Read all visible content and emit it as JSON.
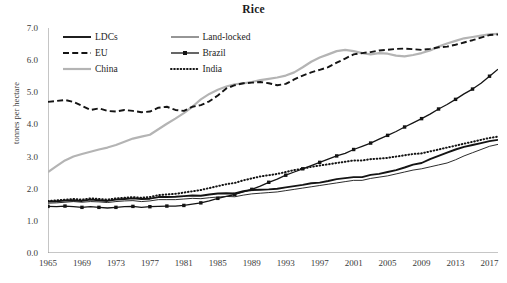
{
  "chart_data": {
    "type": "line",
    "title": "Rice",
    "xlabel": "",
    "ylabel": "tonnes per hectare",
    "ylim": [
      0,
      7
    ],
    "ytick_labels": [
      "0.0",
      "1.0",
      "2.0",
      "3.0",
      "4.0",
      "5.0",
      "6.0",
      "7.0"
    ],
    "ytick_values": [
      0,
      1,
      2,
      3,
      4,
      5,
      6,
      7
    ],
    "xlim": [
      1965,
      2018
    ],
    "xtick_labels": [
      "1965",
      "1969",
      "1973",
      "1977",
      "1981",
      "1985",
      "1989",
      "1993",
      "1997",
      "2001",
      "2005",
      "2009",
      "2013",
      "2017"
    ],
    "xtick_values": [
      1965,
      1969,
      1973,
      1977,
      1981,
      1985,
      1989,
      1993,
      1997,
      2001,
      2005,
      2009,
      2013,
      2017
    ],
    "grid": false,
    "legend_position": "top-left-inside",
    "x": [
      1965,
      1966,
      1967,
      1968,
      1969,
      1970,
      1971,
      1972,
      1973,
      1974,
      1975,
      1976,
      1977,
      1978,
      1979,
      1980,
      1981,
      1982,
      1983,
      1984,
      1985,
      1986,
      1987,
      1988,
      1989,
      1990,
      1991,
      1992,
      1993,
      1994,
      1995,
      1996,
      1997,
      1998,
      1999,
      2000,
      2001,
      2002,
      2003,
      2004,
      2005,
      2006,
      2007,
      2008,
      2009,
      2010,
      2011,
      2012,
      2013,
      2014,
      2015,
      2016,
      2017,
      2018
    ],
    "series": [
      {
        "name": "LDCs",
        "style": "solid-thick",
        "color": "#141414",
        "values": [
          1.6,
          1.61,
          1.63,
          1.64,
          1.62,
          1.66,
          1.64,
          1.62,
          1.66,
          1.68,
          1.7,
          1.68,
          1.69,
          1.74,
          1.74,
          1.75,
          1.77,
          1.79,
          1.78,
          1.82,
          1.85,
          1.86,
          1.85,
          1.92,
          1.96,
          1.97,
          1.98,
          2.0,
          2.04,
          2.08,
          2.12,
          2.17,
          2.19,
          2.24,
          2.3,
          2.33,
          2.36,
          2.36,
          2.43,
          2.46,
          2.52,
          2.58,
          2.66,
          2.75,
          2.8,
          2.92,
          3.02,
          3.12,
          3.22,
          3.3,
          3.36,
          3.42,
          3.48,
          3.52
        ]
      },
      {
        "name": "EU",
        "style": "dashed",
        "color": "#141414",
        "values": [
          4.7,
          4.73,
          4.76,
          4.7,
          4.58,
          4.45,
          4.5,
          4.42,
          4.4,
          4.45,
          4.42,
          4.38,
          4.4,
          4.52,
          4.55,
          4.45,
          4.42,
          4.55,
          4.6,
          4.72,
          4.9,
          5.12,
          5.22,
          5.28,
          5.3,
          5.32,
          5.28,
          5.22,
          5.26,
          5.4,
          5.52,
          5.62,
          5.7,
          5.78,
          5.92,
          6.05,
          6.18,
          6.22,
          6.25,
          6.3,
          6.32,
          6.35,
          6.36,
          6.34,
          6.32,
          6.35,
          6.4,
          6.42,
          6.48,
          6.55,
          6.62,
          6.7,
          6.78,
          6.8
        ]
      },
      {
        "name": "China",
        "style": "solid-gray",
        "color": "#b4b4b4",
        "values": [
          2.52,
          2.7,
          2.88,
          3.0,
          3.08,
          3.15,
          3.22,
          3.28,
          3.36,
          3.46,
          3.56,
          3.62,
          3.68,
          3.85,
          4.02,
          4.18,
          4.35,
          4.55,
          4.78,
          4.95,
          5.08,
          5.18,
          5.25,
          5.28,
          5.32,
          5.38,
          5.42,
          5.46,
          5.52,
          5.62,
          5.78,
          5.95,
          6.08,
          6.18,
          6.28,
          6.32,
          6.28,
          6.22,
          6.18,
          6.22,
          6.2,
          6.14,
          6.12,
          6.16,
          6.22,
          6.3,
          6.42,
          6.52,
          6.6,
          6.68,
          6.72,
          6.76,
          6.8,
          6.82
        ]
      },
      {
        "name": "Land-locked",
        "style": "solid-thin",
        "color": "#141414",
        "values": [
          1.55,
          1.56,
          1.58,
          1.6,
          1.58,
          1.6,
          1.59,
          1.57,
          1.6,
          1.62,
          1.63,
          1.6,
          1.62,
          1.66,
          1.66,
          1.66,
          1.68,
          1.7,
          1.69,
          1.72,
          1.74,
          1.76,
          1.75,
          1.8,
          1.84,
          1.86,
          1.88,
          1.9,
          1.94,
          1.98,
          2.02,
          2.06,
          2.1,
          2.14,
          2.18,
          2.22,
          2.26,
          2.26,
          2.32,
          2.36,
          2.4,
          2.46,
          2.52,
          2.58,
          2.62,
          2.68,
          2.74,
          2.8,
          2.9,
          3.02,
          3.12,
          3.22,
          3.32,
          3.38
        ]
      },
      {
        "name": "Brazil",
        "style": "marker-square",
        "color": "#141414",
        "values": [
          1.45,
          1.44,
          1.46,
          1.44,
          1.42,
          1.44,
          1.42,
          1.4,
          1.42,
          1.44,
          1.45,
          1.42,
          1.44,
          1.45,
          1.46,
          1.46,
          1.48,
          1.52,
          1.56,
          1.62,
          1.7,
          1.76,
          1.82,
          1.9,
          1.98,
          2.08,
          2.2,
          2.3,
          2.42,
          2.52,
          2.62,
          2.72,
          2.82,
          2.92,
          3.02,
          3.1,
          3.22,
          3.32,
          3.42,
          3.54,
          3.66,
          3.78,
          3.92,
          4.05,
          4.18,
          4.32,
          4.48,
          4.62,
          4.78,
          4.95,
          5.1,
          5.28,
          5.5,
          5.72
        ]
      },
      {
        "name": "India",
        "style": "dotted",
        "color": "#141414",
        "values": [
          1.62,
          1.64,
          1.66,
          1.68,
          1.66,
          1.7,
          1.68,
          1.66,
          1.7,
          1.72,
          1.74,
          1.72,
          1.74,
          1.8,
          1.82,
          1.84,
          1.88,
          1.92,
          1.96,
          2.02,
          2.08,
          2.14,
          2.18,
          2.26,
          2.32,
          2.38,
          2.42,
          2.46,
          2.52,
          2.58,
          2.62,
          2.68,
          2.72,
          2.76,
          2.8,
          2.84,
          2.88,
          2.88,
          2.92,
          2.94,
          2.96,
          3.0,
          3.04,
          3.08,
          3.1,
          3.16,
          3.22,
          3.28,
          3.34,
          3.4,
          3.46,
          3.52,
          3.58,
          3.62
        ]
      }
    ],
    "legend": [
      {
        "label": "LDCs",
        "style": "solid-thick",
        "color": "#141414"
      },
      {
        "label": "Land-locked",
        "style": "solid-thin",
        "color": "#141414"
      },
      {
        "label": "EU",
        "style": "dashed",
        "color": "#141414"
      },
      {
        "label": "Brazil",
        "style": "marker-square",
        "color": "#141414"
      },
      {
        "label": "China",
        "style": "solid-gray",
        "color": "#b4b4b4"
      },
      {
        "label": "India",
        "style": "dotted",
        "color": "#141414"
      }
    ]
  }
}
